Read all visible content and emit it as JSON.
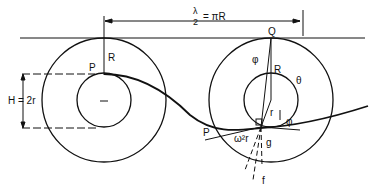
{
  "diagram": {
    "title_formula": {
      "numerator": "λ",
      "denominator": "2",
      "rhs": "= πR"
    },
    "labels": {
      "R_left": "R",
      "P_left": "P",
      "H": "H = 2r",
      "Q": "Q",
      "phi_top": "φ",
      "R_right": "R",
      "theta": "θ",
      "r": "r",
      "phi_right": "φ",
      "P_right": "P",
      "omega": "ω²r",
      "g": "g",
      "f": "f"
    }
  }
}
